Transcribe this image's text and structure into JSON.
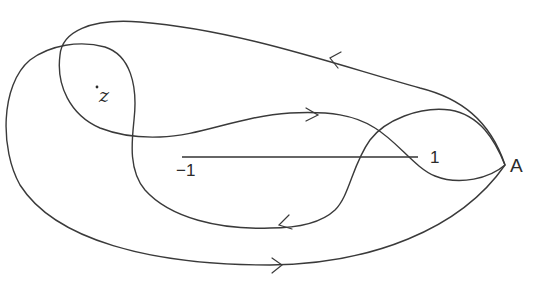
{
  "diagram": {
    "labels": {
      "point_A": "A",
      "point_z": "z",
      "segment_left": "−1",
      "segment_right": "1"
    },
    "segment": {
      "from": "-1",
      "to": "1"
    },
    "stroke_color": "#3a3a3a",
    "arrows": [
      {
        "location": "top outer curve",
        "direction": "left"
      },
      {
        "location": "inner middle curve",
        "direction": "right"
      },
      {
        "location": "inner lower curve",
        "direction": "left"
      },
      {
        "location": "bottom outer curve",
        "direction": "right"
      }
    ]
  }
}
